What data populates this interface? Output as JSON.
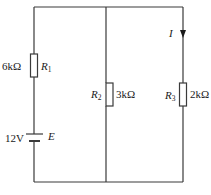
{
  "diagram": {
    "type": "circuit",
    "components": {
      "R1": {
        "name": "R",
        "sub": "1",
        "value": "6kΩ"
      },
      "R2": {
        "name": "R",
        "sub": "2",
        "value": "3kΩ"
      },
      "R3": {
        "name": "R",
        "sub": "3",
        "value": "2kΩ"
      },
      "E": {
        "name": "E",
        "value": "12V"
      }
    },
    "current": {
      "label": "I",
      "direction": "down",
      "branch": "R3"
    },
    "colors": {
      "wire": "#3a3a3a",
      "background": "#ffffff"
    }
  }
}
